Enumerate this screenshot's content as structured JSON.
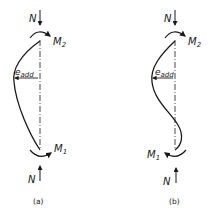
{
  "figure": {
    "panels": [
      {
        "id": "a",
        "caption": "(a)",
        "axial_force_top": "N",
        "axial_force_bottom": "N",
        "moment_top": "M",
        "moment_top_sub": "2",
        "moment_bottom": "M",
        "moment_bottom_sub": "1",
        "eccentricity": "e",
        "eccentricity_sub": "add",
        "curvature": "single"
      },
      {
        "id": "b",
        "caption": "(b)",
        "axial_force_top": "N",
        "axial_force_bottom": "N",
        "moment_top": "M",
        "moment_top_sub": "2",
        "moment_bottom": "M",
        "moment_bottom_sub": "1",
        "eccentricity": "e",
        "eccentricity_sub": "add",
        "curvature": "double"
      }
    ],
    "colors": {
      "ink": "#1a1a1a",
      "background": "#ffffff"
    }
  }
}
